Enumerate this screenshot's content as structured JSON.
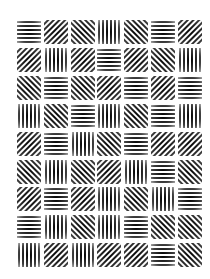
{
  "figure": {
    "type": "gabor-patch-grid",
    "rows": 9,
    "cols": 7,
    "background": "#ffffff",
    "ink": "#000000",
    "grid_origin": [
      29,
      32
    ],
    "col_spacing": 26.8,
    "row_spacing": 27.9,
    "patch_size": 24
  },
  "patches": [
    [
      "H",
      "D",
      "A",
      "V",
      "A",
      "H",
      "D"
    ],
    [
      "D",
      "V",
      "D",
      "H",
      "D",
      "A",
      "V"
    ],
    [
      "A",
      "H",
      "A",
      "D",
      "H",
      "D",
      "H"
    ],
    [
      "V",
      "A",
      "H",
      "V",
      "A",
      "H",
      "V"
    ],
    [
      "D",
      "H",
      "V",
      "A",
      "H",
      "D",
      "D"
    ],
    [
      "A",
      "V",
      "A",
      "D",
      "V",
      "H",
      "A"
    ],
    [
      "D",
      "H",
      "D",
      "V",
      "A",
      "V",
      "H"
    ],
    [
      "H",
      "V",
      "A",
      "V",
      "H",
      "A",
      "A"
    ],
    [
      "V",
      "D",
      "V",
      "D",
      "D",
      "H",
      "A"
    ]
  ],
  "orientation_legend": {
    "H": "horizontal (0°)",
    "V": "vertical (90°)",
    "D": "diagonal (45°, /)",
    "A": "anti-diagonal (-45°, \\)"
  },
  "angles": {
    "H": 0,
    "V": 90,
    "D": -45,
    "A": 45
  }
}
